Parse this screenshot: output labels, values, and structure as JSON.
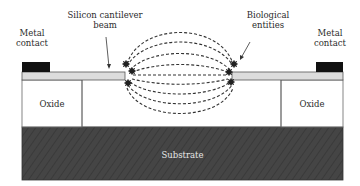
{
  "diagram": {
    "type": "cross-section",
    "labels": {
      "metal_contact_left": [
        "Metal",
        "contact"
      ],
      "cantilever": [
        "Silicon cantilever",
        "beam"
      ],
      "biological": [
        "Biological",
        "entities"
      ],
      "metal_contact_right": [
        "Metal",
        "contact"
      ],
      "oxide_left": "Oxide",
      "oxide_right": "Oxide",
      "substrate": "Substrate"
    },
    "colors": {
      "metal": "#111111",
      "beam": "#dcdcdc",
      "oxide": "#ffffff",
      "substrate": "#444444",
      "field_lines": "#333333",
      "outline": "#555555"
    }
  }
}
